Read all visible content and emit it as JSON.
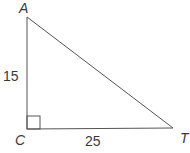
{
  "diagram": {
    "type": "right-triangle",
    "vertices": {
      "A": {
        "label": "A"
      },
      "C": {
        "label": "C"
      },
      "T": {
        "label": "T"
      }
    },
    "sides": {
      "AC": {
        "label": "15"
      },
      "CT": {
        "label": "25"
      }
    },
    "right_angle_at": "C",
    "colors": {
      "stroke": "#555555",
      "text": "#3a3a3a"
    }
  }
}
